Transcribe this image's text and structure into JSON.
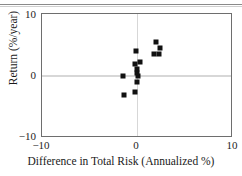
{
  "figure": {
    "top_rule": "horizontal-rule",
    "background": "#ffffff",
    "marker_color": "#111111",
    "frame_color": "#6e6e6e",
    "grid_color": "#d7d7d7"
  },
  "axis": {
    "x_title": "Difference in Total Risk (Annualized %)",
    "y_title": "Return (%/year)",
    "x_ticks": [
      "−10",
      "0",
      "10"
    ],
    "y_ticks": [
      "10",
      "0",
      "−10"
    ]
  },
  "chart_data": {
    "type": "scatter",
    "title": "",
    "xlabel": "Difference in Total Risk (Annualized %)",
    "ylabel": "Return (%/year)",
    "xlim": [
      -10,
      10
    ],
    "ylim": [
      -10,
      10
    ],
    "xticks": [
      -10,
      0,
      10
    ],
    "yticks": [
      -10,
      0,
      10
    ],
    "grid": true,
    "gridlines": {
      "vertical": [
        0
      ],
      "horizontal": [
        0
      ]
    },
    "legend": null,
    "series": [
      {
        "name": "funds",
        "marker": "square",
        "color": "#111111",
        "points": [
          {
            "x": -1.5,
            "y": 0.0
          },
          {
            "x": -1.4,
            "y": -3.0
          },
          {
            "x": -0.3,
            "y": -2.5
          },
          {
            "x": -0.1,
            "y": -1.0
          },
          {
            "x": 0.1,
            "y": 0.0
          },
          {
            "x": -0.1,
            "y": 0.5
          },
          {
            "x": -0.1,
            "y": 1.2
          },
          {
            "x": -0.3,
            "y": 2.0
          },
          {
            "x": 0.3,
            "y": 2.3
          },
          {
            "x": -0.2,
            "y": 4.0
          },
          {
            "x": 1.9,
            "y": 5.5
          },
          {
            "x": 2.4,
            "y": 4.5
          },
          {
            "x": 1.7,
            "y": 3.5
          },
          {
            "x": 2.2,
            "y": 3.5
          }
        ]
      }
    ]
  }
}
